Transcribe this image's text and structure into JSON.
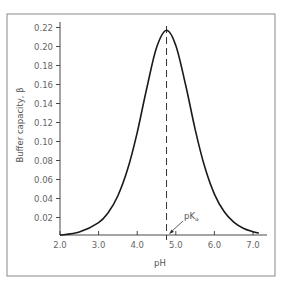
{
  "chart_data": {
    "type": "line",
    "title": "",
    "xlabel": "pH",
    "ylabel": "Buffer capacity, β",
    "xlim": [
      2.0,
      7.2
    ],
    "ylim": [
      0.0,
      0.225
    ],
    "xticks": [
      "2.0",
      "3.0",
      "4.0",
      "5.0",
      "6.0",
      "7.0"
    ],
    "yticks": [
      "0.02",
      "0.04",
      "0.06",
      "0.08",
      "0.10",
      "0.12",
      "0.14",
      "0.16",
      "0.18",
      "0.20",
      "0.22"
    ],
    "grid": false,
    "legend": null,
    "series": [
      {
        "name": "Buffer capacity",
        "x": [
          2.0,
          2.5,
          3.0,
          3.25,
          3.5,
          3.75,
          4.0,
          4.25,
          4.5,
          4.76,
          5.0,
          5.25,
          5.5,
          5.75,
          6.0,
          6.25,
          6.5,
          6.75,
          7.0,
          7.15
        ],
        "y": [
          0.0015,
          0.0047,
          0.0146,
          0.0253,
          0.0429,
          0.0704,
          0.1094,
          0.1566,
          0.1987,
          0.217,
          0.2012,
          0.1605,
          0.113,
          0.0731,
          0.0446,
          0.0263,
          0.0152,
          0.0087,
          0.005,
          0.0035
        ]
      }
    ],
    "annotations": [
      {
        "text": "pK",
        "subscript": "a",
        "x": 4.76,
        "type": "dashed-vertical-line-with-arrow"
      }
    ]
  },
  "labels": {
    "xlabel": "pH",
    "ylabel": "Buffer capacity, β",
    "pka_main": "pK",
    "pka_sub": "a"
  },
  "colors": {
    "curve": "#1a1a1a",
    "axis": "#333333",
    "frame": "#888888",
    "text": "#666666"
  }
}
